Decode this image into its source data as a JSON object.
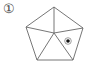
{
  "figure": {
    "label": "①",
    "shape": "pentagon divided into 5 triangles from center",
    "stroke_color": "#666666",
    "vertices": [
      [
        54,
        7
      ],
      [
        83,
        28
      ],
      [
        73,
        60
      ],
      [
        37,
        60
      ],
      [
        26,
        27
      ]
    ],
    "center": [
      54,
      33
    ],
    "marker": {
      "icon": "bullseye-dot",
      "position": [
        68,
        41
      ],
      "color": "#111111"
    }
  }
}
